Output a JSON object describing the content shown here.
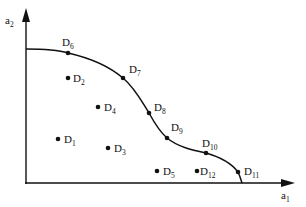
{
  "axes": {
    "x_label": "a",
    "x_sub": "1",
    "y_label": "a",
    "y_sub": "2"
  },
  "frontier_points": [
    {
      "name": "D",
      "sub": "6",
      "x": 68,
      "y": 53,
      "lx": 62,
      "ly": 46
    },
    {
      "name": "D",
      "sub": "7",
      "x": 123,
      "y": 78,
      "lx": 129,
      "ly": 73
    },
    {
      "name": "D",
      "sub": "8",
      "x": 149,
      "y": 113,
      "lx": 154,
      "ly": 111
    },
    {
      "name": "D",
      "sub": "9",
      "x": 167,
      "y": 138,
      "lx": 171,
      "ly": 131
    },
    {
      "name": "D",
      "sub": "10",
      "x": 206,
      "y": 153,
      "lx": 202,
      "ly": 147
    },
    {
      "name": "D",
      "sub": "11",
      "x": 238,
      "y": 172,
      "lx": 244,
      "ly": 175
    }
  ],
  "interior_points": [
    {
      "name": "D",
      "sub": "2",
      "x": 68,
      "y": 78,
      "lx": 73,
      "ly": 82
    },
    {
      "name": "D",
      "sub": "4",
      "x": 98,
      "y": 107,
      "lx": 104,
      "ly": 111
    },
    {
      "name": "D",
      "sub": "1",
      "x": 58,
      "y": 139,
      "lx": 64,
      "ly": 143
    },
    {
      "name": "D",
      "sub": "3",
      "x": 108,
      "y": 148,
      "lx": 114,
      "ly": 152
    },
    {
      "name": "D",
      "sub": "5",
      "x": 157,
      "y": 171,
      "lx": 163,
      "ly": 175
    },
    {
      "name": "D",
      "sub": "12",
      "x": 197,
      "y": 171,
      "lx": 200,
      "ly": 175
    }
  ],
  "colors": {
    "ink": "#111111",
    "background": "#ffffff"
  }
}
